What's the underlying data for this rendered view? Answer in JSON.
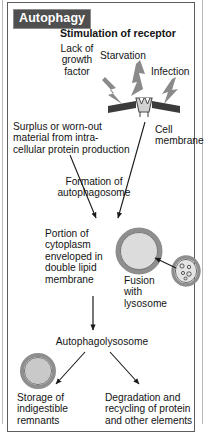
{
  "figure": {
    "title": "Autophagy",
    "type": "biological-process-diagram",
    "background_color": "#ffffff",
    "banner_color": "#4f4f4f",
    "banner_text_color": "#ffffff",
    "line_color": "#1a1a1a",
    "organelle_fill": "#d9d9d9",
    "organelle_ring": "#8e8e8e",
    "membrane_color": "#3a3a3a",
    "bolt_color": "#878787"
  },
  "labels": {
    "stimulation": "Stimulation of receptor",
    "lack_of_growth_factor": "Lack of\ngrowth\nfactor",
    "starvation": "Starvation",
    "infection": "Infection",
    "surplus": "Surplus or worn-out\nmaterial from intra-\ncellular protein production",
    "cell_membrane": "Cell\nmembrane",
    "formation": "Formation of\nautophagosome",
    "portion": "Portion of\ncytoplasm\nenveloped in\ndouble lipid\nmembrane",
    "fusion": "Fusion\nwith\nlysosome",
    "autophagolysosome": "Autophagolysosome",
    "storage": "Storage of\nindigestible\nremnants",
    "degradation": "Degradation and\nrecycling of protein\nand other elements"
  },
  "shapes": {
    "autophagosome": "double-membrane-vesicle",
    "lysosome": "granular-vesicle",
    "residual_body": "residual-body-vesicle",
    "receptor": "membrane-receptor",
    "stimuli_arrows": [
      "lightning-bolt",
      "lightning-bolt",
      "lightning-bolt"
    ]
  }
}
